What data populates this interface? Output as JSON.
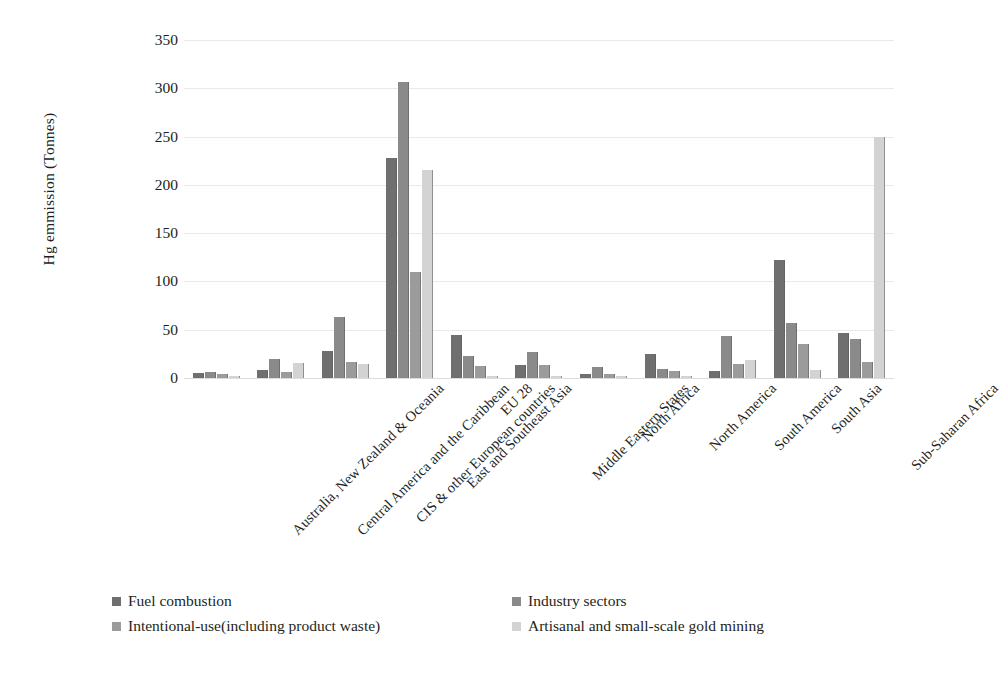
{
  "chart_data": {
    "type": "bar",
    "title": "",
    "xlabel": "",
    "ylabel": "Hg emmission (Tonnes)",
    "ylim": [
      0,
      350
    ],
    "yticks": [
      0,
      50,
      100,
      150,
      200,
      250,
      300,
      350
    ],
    "grid": true,
    "legend_position": "bottom",
    "categories": [
      "Australia, New Zealand & Oceania",
      "Central America and the Caribbean",
      "CIS & other European countries",
      "East and Southeast Asia",
      "EU 28",
      "Middle Eastern States",
      "North Africa",
      "North America",
      "South America",
      "South Asia",
      "Sub-Saharan Africa"
    ],
    "series": [
      {
        "name": "Fuel combustion",
        "color": "#6f6f6f",
        "values": [
          5,
          8,
          28,
          228,
          45,
          13,
          4,
          25,
          7,
          122,
          47
        ]
      },
      {
        "name": "Industry sectors",
        "color": "#8a8a8a",
        "values": [
          6,
          20,
          63,
          307,
          23,
          27,
          11,
          9,
          44,
          57,
          40
        ]
      },
      {
        "name": "Intentional-use(including product waste)",
        "color": "#9b9b9b",
        "values": [
          4,
          6,
          17,
          110,
          12,
          13,
          4,
          7,
          14,
          35,
          17
        ]
      },
      {
        "name": "Artisanal and small-scale gold mining",
        "color": "#d3d3d3",
        "values": [
          2,
          16,
          14,
          215,
          2,
          2,
          2,
          2,
          19,
          8,
          250
        ]
      }
    ],
    "legend": [
      "Fuel combustion",
      "Industry sectors",
      "Intentional-use(including product waste)",
      "Artisanal and small-scale gold mining"
    ]
  }
}
